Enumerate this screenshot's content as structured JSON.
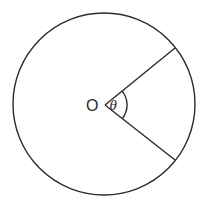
{
  "diagram": {
    "type": "circle-sector-angle",
    "center_label": "O",
    "angle_label": "θ",
    "elements": [
      {
        "kind": "circle",
        "name": "circle"
      },
      {
        "kind": "radius",
        "name": "radius-upper"
      },
      {
        "kind": "radius",
        "name": "radius-lower"
      },
      {
        "kind": "angle-arc",
        "name": "angle-arc"
      }
    ],
    "colors": {
      "stroke": "#2a2a2a",
      "background": "#ffffff"
    }
  }
}
